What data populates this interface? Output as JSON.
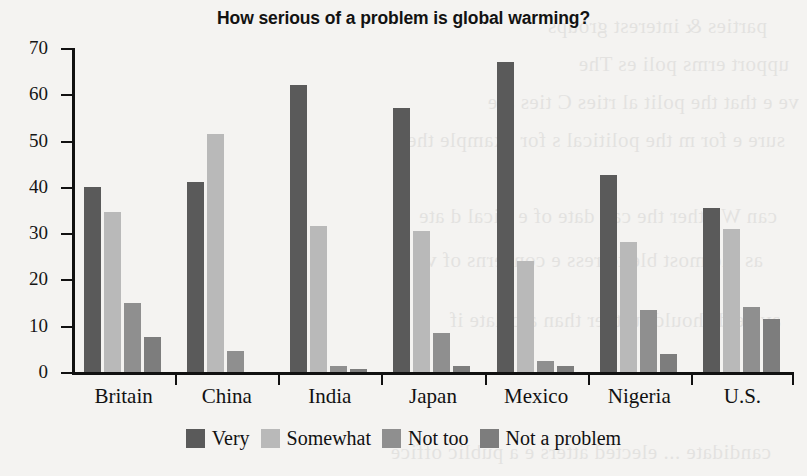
{
  "chart_data": {
    "type": "bar",
    "title": "How serious of a problem is global warming?",
    "xlabel": "",
    "ylabel": "",
    "ylim": [
      0,
      70
    ],
    "yticks": [
      0,
      10,
      20,
      30,
      40,
      50,
      60,
      70
    ],
    "grid": false,
    "legend_position": "bottom",
    "categories": [
      "Britain",
      "China",
      "India",
      "Japan",
      "Mexico",
      "Nigeria",
      "U.S."
    ],
    "series": [
      {
        "name": "Very",
        "color": "#5a5a5a",
        "values": [
          40,
          41,
          62,
          57,
          67,
          42.5,
          35.5
        ]
      },
      {
        "name": "Somewhat",
        "color": "#b9b9b9",
        "values": [
          34.5,
          51.5,
          31.5,
          30.5,
          24,
          28,
          31
        ]
      },
      {
        "name": "Not too",
        "color": "#8f8f8f",
        "values": [
          15,
          4.5,
          1.3,
          8.5,
          2.3,
          13.3,
          14
        ]
      },
      {
        "name": "Not a problem",
        "color": "#7d7d7d",
        "values": [
          7.5,
          0,
          0.6,
          1.3,
          1.2,
          4,
          11.5
        ]
      }
    ]
  },
  "bleed_text": [
    "parties & interest groups",
    "upport   erms   poli es   The",
    "ve     e that the polit al    rties   C    ties are",
    "sure   e    for  m   the political s for  example the",
    "can   W other   the can   date of   e    itical d   ate",
    "as the most  ble to  ress    e concerns of vo  rs",
    "ave     e   d     should further than a c    date   if",
    "candidate   ...  elected   atters   e a public office"
  ]
}
